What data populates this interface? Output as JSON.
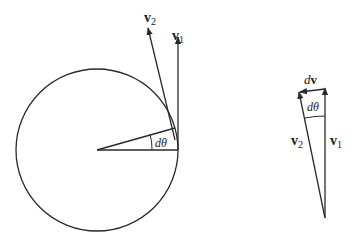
{
  "diagram": {
    "left_figure": {
      "circle": {
        "cx": 97,
        "cy": 150,
        "r": 81
      },
      "velocity_labels": {
        "v1": {
          "base": "v",
          "sub": "1"
        },
        "v2": {
          "base": "v",
          "sub": "2"
        }
      },
      "angle_label": {
        "d": "d",
        "theta": "θ"
      }
    },
    "right_figure": {
      "labels": {
        "dv": {
          "d": "d",
          "v": "v"
        },
        "angle": {
          "d": "d",
          "theta": "θ"
        },
        "v1": {
          "base": "v",
          "sub": "1"
        },
        "v2": {
          "base": "v",
          "sub": "2"
        }
      }
    },
    "stroke_color": "#2a2a2a"
  }
}
